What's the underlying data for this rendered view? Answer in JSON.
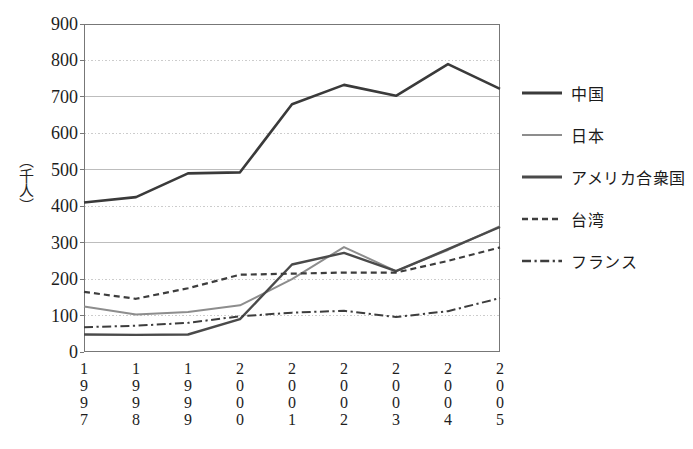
{
  "chart_data": {
    "type": "line",
    "title": "",
    "xlabel": "",
    "ylabel": "（千人）",
    "ylim": [
      0,
      900
    ],
    "ytick_step": 100,
    "grid": true,
    "legend_position": "right",
    "categories": [
      "1997",
      "1998",
      "1999",
      "2000",
      "2001",
      "2002",
      "2003",
      "2004",
      "2005"
    ],
    "yticks": [
      "900",
      "800",
      "700",
      "600",
      "500",
      "400",
      "300",
      "200",
      "100",
      "0"
    ],
    "series": [
      {
        "name": "中国",
        "style": "solid",
        "color": "#3a3a3a",
        "width": 2.6,
        "values": [
          410,
          425,
          490,
          493,
          680,
          733,
          703,
          790,
          722
        ]
      },
      {
        "name": "日本",
        "style": "solid",
        "color": "#8d8d8d",
        "width": 2.0,
        "values": [
          125,
          103,
          110,
          128,
          200,
          288,
          222,
          280,
          345
        ]
      },
      {
        "name": "アメリカ合衆国",
        "style": "solid",
        "color": "#4a4a4a",
        "width": 2.4,
        "values": [
          48,
          47,
          48,
          90,
          240,
          272,
          222,
          282,
          343
        ]
      },
      {
        "name": "台湾",
        "style": "dashed",
        "color": "#3d3d3d",
        "width": 2.2,
        "values": [
          165,
          146,
          175,
          212,
          215,
          218,
          218,
          250,
          287
        ]
      },
      {
        "name": "フランス",
        "style": "dashdot",
        "color": "#3d3d3d",
        "width": 2.0,
        "values": [
          68,
          72,
          80,
          98,
          108,
          113,
          96,
          112,
          148
        ]
      }
    ]
  },
  "axis": {
    "y_title": "（千人）",
    "y_ticks": [
      "900",
      "800",
      "700",
      "600",
      "500",
      "400",
      "300",
      "200",
      "100",
      "0"
    ],
    "x_ticks": [
      {
        "label": "1997",
        "digits": [
          "1",
          "9",
          "9",
          "7"
        ]
      },
      {
        "label": "1998",
        "digits": [
          "1",
          "9",
          "9",
          "8"
        ]
      },
      {
        "label": "1999",
        "digits": [
          "1",
          "9",
          "9",
          "9"
        ]
      },
      {
        "label": "2000",
        "digits": [
          "2",
          "0",
          "0",
          "0"
        ]
      },
      {
        "label": "2001",
        "digits": [
          "2",
          "0",
          "0",
          "1"
        ]
      },
      {
        "label": "2002",
        "digits": [
          "2",
          "0",
          "0",
          "2"
        ]
      },
      {
        "label": "2003",
        "digits": [
          "2",
          "0",
          "0",
          "3"
        ]
      },
      {
        "label": "2004",
        "digits": [
          "2",
          "0",
          "0",
          "4"
        ]
      },
      {
        "label": "2005",
        "digits": [
          "2",
          "0",
          "0",
          "5"
        ]
      }
    ]
  },
  "legend": {
    "items": [
      {
        "label": "中国",
        "style": "solid",
        "color": "#3a3a3a",
        "width": 3.0
      },
      {
        "label": "日本",
        "style": "solid",
        "color": "#8d8d8d",
        "width": 2.2
      },
      {
        "label": "アメリカ合衆国",
        "style": "solid",
        "color": "#4a4a4a",
        "width": 3.2
      },
      {
        "label": "台湾",
        "style": "dashed",
        "color": "#3d3d3d",
        "width": 2.4
      },
      {
        "label": "フランス",
        "style": "dashdot",
        "color": "#3d3d3d",
        "width": 2.4
      }
    ]
  },
  "colors": {
    "frame": "#777777",
    "gridline": "#bdbdbd",
    "gridline_dotted": "#cccccc",
    "background": "#ffffff",
    "text": "#1d1d1d"
  }
}
